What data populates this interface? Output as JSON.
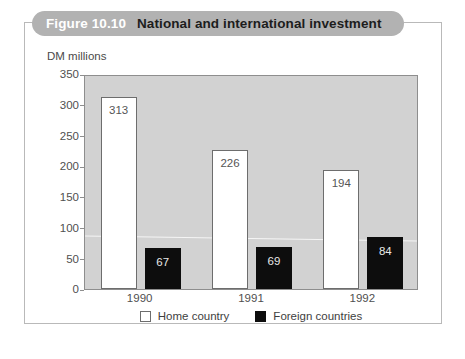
{
  "figure": {
    "number": "Figure 10.10",
    "title": "National and international investment"
  },
  "chart_data": {
    "type": "bar",
    "title": "National and international investment",
    "xlabel": "",
    "ylabel": "DM millions",
    "unit_caption": "DM millions",
    "ylim": [
      0,
      350
    ],
    "ytick_step": 50,
    "yticks": [
      "0",
      "50",
      "100",
      "150",
      "200",
      "250",
      "300",
      "350"
    ],
    "categories": [
      "1990",
      "1991",
      "1992"
    ],
    "grid": false,
    "legend_position": "bottom-center",
    "series": [
      {
        "name": "Home country",
        "color": "#ffffff",
        "values": [
          313,
          226,
          194
        ],
        "labels": [
          "313",
          "226",
          "194"
        ]
      },
      {
        "name": "Foreign countries",
        "color": "#0d0d0d",
        "values": [
          67,
          69,
          84
        ],
        "labels": [
          "67",
          "69",
          "84"
        ]
      }
    ]
  },
  "colors": {
    "banner": "#b2b2b2",
    "plot_background": "#d2d2d2",
    "frame": "#b9b9b9",
    "axis": "#8e8e8e",
    "home_bar": "#ffffff",
    "foreign_bar": "#0d0d0d"
  }
}
